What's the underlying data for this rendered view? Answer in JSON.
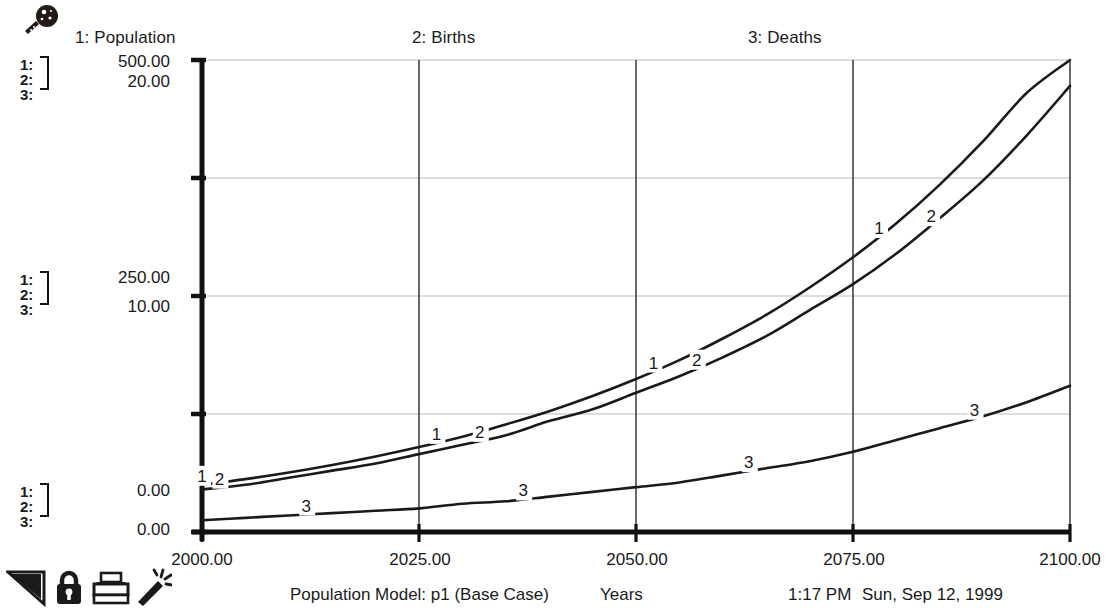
{
  "window": {
    "tool_icon": "magnifier-icon"
  },
  "legend": {
    "items": [
      {
        "id": "1",
        "label": "1: Population"
      },
      {
        "id": "2",
        "label": "2: Births"
      },
      {
        "id": "3",
        "label": "3: Deaths"
      }
    ]
  },
  "y_axis": {
    "stacks": [
      {
        "rows": [
          "1:",
          "2:",
          "3:"
        ]
      },
      {
        "rows": [
          "1:",
          "2:",
          "3:"
        ]
      },
      {
        "rows": [
          "1:",
          "2:",
          "3:"
        ]
      }
    ],
    "labels": {
      "top_primary": "500.00",
      "top_secondary": "20.00",
      "mid_primary": "250.00",
      "mid_secondary": "10.00",
      "bot_primary": "0.00",
      "bot_secondary": "0.00"
    }
  },
  "x_axis": {
    "ticks": [
      "2000.00",
      "2025.00",
      "2050.00",
      "2075.00",
      "2100.00"
    ]
  },
  "toolbar": {
    "items": [
      {
        "name": "page-corner-icon",
        "label": "Page"
      },
      {
        "name": "lock-icon",
        "label": "Lock"
      },
      {
        "name": "printer-icon",
        "label": "Print"
      },
      {
        "name": "magic-wand-icon",
        "label": "Wand"
      }
    ]
  },
  "status": {
    "title": "Population Model: p1 (Base Case)",
    "xlabel": "Years",
    "time": "1:17 PM",
    "date": "Sun, Sep 12, 1999"
  },
  "colors": {
    "ink": "#1a1a1a",
    "grid": "#b9b9b9",
    "axis": "#111111",
    "background": "#ffffff"
  },
  "chart_data": {
    "type": "line",
    "title": "Population Model: p1 (Base Case)",
    "xlabel": "Years",
    "ylabel": "",
    "xlim": [
      2000,
      2100
    ],
    "xticks": [
      2000,
      2025,
      2050,
      2075,
      2100
    ],
    "grid": true,
    "legend_position": "top",
    "axes": [
      {
        "id": "1",
        "name": "Population",
        "range": [
          0,
          500
        ],
        "ticks": [
          0,
          250,
          500
        ]
      },
      {
        "id": "2",
        "name": "Births",
        "range": [
          0,
          20
        ],
        "ticks": [
          0,
          10,
          20
        ]
      },
      {
        "id": "3",
        "name": "Deaths",
        "range": [
          0,
          20
        ],
        "ticks": [
          0,
          10,
          20
        ]
      }
    ],
    "x": [
      2000,
      2005,
      2010,
      2015,
      2020,
      2025,
      2030,
      2035,
      2040,
      2045,
      2050,
      2055,
      2060,
      2065,
      2070,
      2075,
      2080,
      2085,
      2090,
      2095,
      2100
    ],
    "series": [
      {
        "name": "Population",
        "id": "1",
        "axis": "1",
        "units": "people",
        "values": [
          50,
          56,
          63,
          71,
          80,
          90,
          101,
          114,
          128,
          144,
          162,
          182,
          205,
          230,
          259,
          291,
          327,
          368,
          414,
          465,
          500
        ]
      },
      {
        "name": "Births",
        "id": "2",
        "axis": "2",
        "units": "people/year",
        "values": [
          1.8,
          2.0,
          2.3,
          2.6,
          2.9,
          3.3,
          3.7,
          4.1,
          4.7,
          5.2,
          5.9,
          6.6,
          7.4,
          8.3,
          9.4,
          10.5,
          11.8,
          13.3,
          14.9,
          16.8,
          18.9
        ]
      },
      {
        "name": "Deaths",
        "id": "3",
        "axis": "3",
        "units": "people/year",
        "values": [
          0.5,
          0.6,
          0.7,
          0.8,
          0.9,
          1.0,
          1.2,
          1.3,
          1.5,
          1.7,
          1.9,
          2.1,
          2.4,
          2.7,
          3.0,
          3.4,
          3.9,
          4.4,
          4.9,
          5.5,
          6.2
        ]
      }
    ],
    "inline_labels": [
      {
        "series": "1",
        "text": "1",
        "x": 2000
      },
      {
        "series": "1",
        "text": "1",
        "x": 2027
      },
      {
        "series": "1",
        "text": "1",
        "x": 2052
      },
      {
        "series": "1",
        "text": "1",
        "x": 2078
      },
      {
        "series": "2",
        "text": "2",
        "x": 2002
      },
      {
        "series": "2",
        "text": "2",
        "x": 2032
      },
      {
        "series": "2",
        "text": "2",
        "x": 2057
      },
      {
        "series": "2",
        "text": "2",
        "x": 2084
      },
      {
        "series": "3",
        "text": "3",
        "x": 2012
      },
      {
        "series": "3",
        "text": "3",
        "x": 2037
      },
      {
        "series": "3",
        "text": "3",
        "x": 2063
      },
      {
        "series": "3",
        "text": "3",
        "x": 2089
      }
    ]
  }
}
